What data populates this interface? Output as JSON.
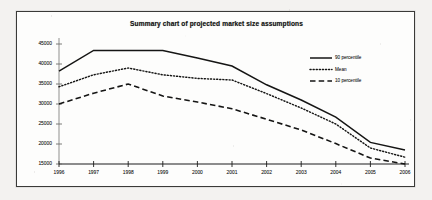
{
  "chart_data": {
    "type": "line",
    "title": "Summary chart of projected market size assumptions",
    "xlabel": "",
    "ylabel": "",
    "grid": false,
    "legend_position": "top-right",
    "categories": [
      "1996",
      "1997",
      "1998",
      "1999",
      "2000",
      "2001",
      "2002",
      "2003",
      "2004",
      "2005",
      "2006"
    ],
    "x": [
      1996,
      1997,
      1998,
      1999,
      2000,
      2001,
      2002,
      2003,
      2004,
      2005,
      2006
    ],
    "ylim": [
      15000,
      45000
    ],
    "yticks": [
      15000,
      20000,
      25000,
      30000,
      35000,
      40000,
      45000
    ],
    "ytick_labels": [
      "15000",
      "20000",
      "25000",
      "30000",
      "35000",
      "40000",
      "45000"
    ],
    "series": [
      {
        "name": "90 percentile",
        "style": "solid",
        "color": "#151514",
        "values": [
          38200,
          43400,
          43400,
          43400,
          41500,
          39500,
          34800,
          31000,
          26700,
          20400,
          18500
        ]
      },
      {
        "name": "Mean",
        "style": "dotted",
        "color": "#151514",
        "values": [
          34300,
          37300,
          39000,
          37300,
          36400,
          36000,
          32600,
          29000,
          25000,
          19000,
          16700
        ]
      },
      {
        "name": "10 percentile",
        "style": "dashed",
        "color": "#151514",
        "values": [
          30000,
          32700,
          35000,
          32000,
          30500,
          28800,
          26200,
          23500,
          20100,
          16500,
          15000
        ]
      }
    ]
  },
  "legend": {
    "items": [
      {
        "label": "90 percentile",
        "style": "solid"
      },
      {
        "label": "Mean",
        "style": "dotted"
      },
      {
        "label": "10 percentile",
        "style": "dashed"
      }
    ]
  },
  "colors": {
    "ink": "#151514",
    "paper": "#fdfdfc",
    "scan_background": "#f3f2f0",
    "border": "#3a3a38"
  }
}
